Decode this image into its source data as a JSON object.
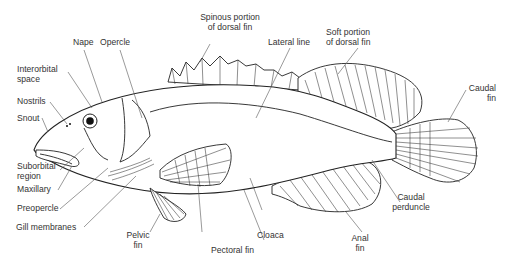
{
  "diagram": {
    "labels": {
      "nape": "Nape",
      "opercle": "Opercle",
      "spinous_dorsal_1": "Spinous portion",
      "spinous_dorsal_2": "of dorsal fin",
      "lateral_line": "Lateral line",
      "soft_dorsal_1": "Soft portion",
      "soft_dorsal_2": "of dorsal fin",
      "interorbital_1": "Interorbital",
      "interorbital_2": "space",
      "nostrils": "Nostrils",
      "snout": "Snout",
      "caudal_fin_1": "Caudal",
      "caudal_fin_2": "fin",
      "suborbital_1": "Suborbital",
      "suborbital_2": "region",
      "maxillary": "Maxillary",
      "preopercle": "Preopercle",
      "gill_membranes": "Gill membranes",
      "pelvic_fin_1": "Pelvic",
      "pelvic_fin_2": "fin",
      "pectoral_fin": "Pectoral fin",
      "cloaca": "Cloaca",
      "anal_fin_1": "Anal",
      "anal_fin_2": "fin",
      "caudal_peduncle_1": "Caudal",
      "caudal_peduncle_2": "perduncle"
    }
  }
}
